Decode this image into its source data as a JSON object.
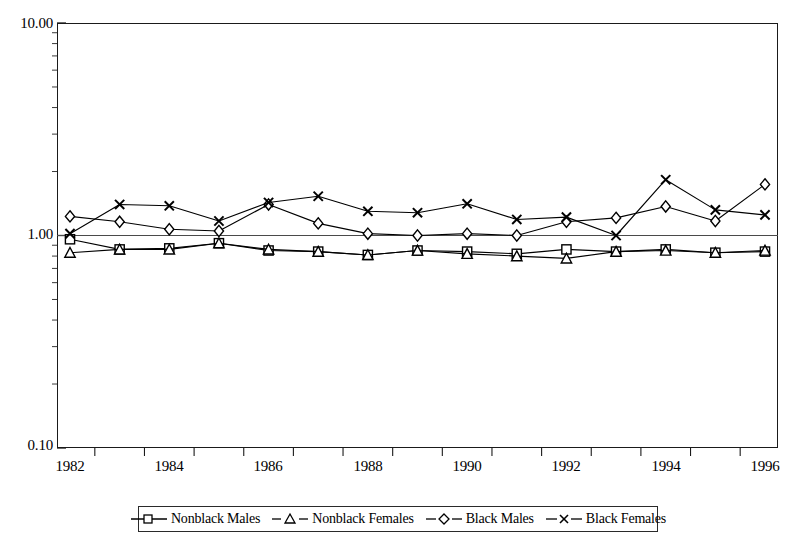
{
  "chart": {
    "title": "",
    "subtitle": "",
    "type": "line"
  },
  "axes": {
    "y": {
      "scale": "log",
      "labels": [
        "10.00",
        "1.00",
        "0.10"
      ],
      "values": [
        10.0,
        1.0,
        0.1
      ],
      "min": 0.1,
      "max": 10.0,
      "title": ""
    },
    "x": {
      "title": "",
      "labels": [
        "1982",
        "1984",
        "1986",
        "1988",
        "1990",
        "1992",
        "1994",
        "1996"
      ],
      "min": 1982,
      "max": 1996
    }
  },
  "legend": {
    "position": "bottom",
    "items": [
      {
        "label": "Nonblack Males",
        "marker": "square",
        "color": "#000000"
      },
      {
        "label": "Nonblack Females",
        "marker": "triangle",
        "color": "#000000"
      },
      {
        "label": "Black Males",
        "marker": "diamond",
        "color": "#000000"
      },
      {
        "label": "Black Females",
        "marker": "x",
        "color": "#000000"
      }
    ]
  },
  "chart_data": {
    "type": "line",
    "title": "",
    "xlabel": "",
    "ylabel": "",
    "yscale": "log",
    "ylim": [
      0.1,
      10.0
    ],
    "xlim": [
      1982,
      1996
    ],
    "grid": false,
    "legend_position": "bottom",
    "ytick_labels": [
      "10.00",
      "1.00",
      "0.10"
    ],
    "ytick_values": [
      10.0,
      1.0,
      0.1
    ],
    "xtick_labels": [
      "1982",
      "1984",
      "1986",
      "1988",
      "1990",
      "1992",
      "1994",
      "1996"
    ],
    "x": [
      1982,
      1983,
      1984,
      1985,
      1986,
      1987,
      1988,
      1989,
      1990,
      1991,
      1992,
      1993,
      1994,
      1995,
      1996
    ],
    "series": [
      {
        "name": "Nonblack Males",
        "marker": "square",
        "values": [
          0.96,
          0.86,
          0.87,
          0.92,
          0.85,
          0.84,
          0.81,
          0.85,
          0.84,
          0.82,
          0.86,
          0.84,
          0.86,
          0.83,
          0.84
        ]
      },
      {
        "name": "Nonblack Females",
        "marker": "triangle",
        "values": [
          0.83,
          0.86,
          0.86,
          0.92,
          0.86,
          0.84,
          0.81,
          0.85,
          0.82,
          0.8,
          0.78,
          0.84,
          0.85,
          0.83,
          0.85
        ]
      },
      {
        "name": "Black Males",
        "marker": "diamond",
        "values": [
          1.23,
          1.16,
          1.07,
          1.05,
          1.4,
          1.14,
          1.02,
          1.0,
          1.02,
          1.0,
          1.16,
          1.21,
          1.37,
          1.17,
          1.74
        ]
      },
      {
        "name": "Black Females",
        "marker": "x",
        "values": [
          1.02,
          1.4,
          1.38,
          1.17,
          1.43,
          1.53,
          1.3,
          1.28,
          1.41,
          1.19,
          1.22,
          1.0,
          1.83,
          1.32,
          1.25
        ]
      }
    ]
  }
}
